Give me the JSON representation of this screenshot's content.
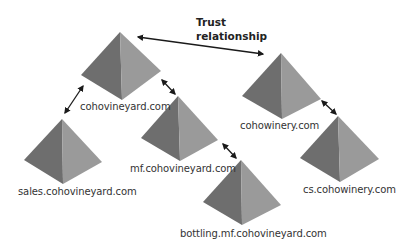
{
  "diagram": {
    "type": "domain trust hierarchy",
    "colors": {
      "face_left": "#6e6e6e",
      "face_right": "#9a9a9a",
      "arrow": "#1a1a1a",
      "background": "#ffffff"
    },
    "trust_label": {
      "line1": "Trust",
      "line2": "relationship"
    },
    "nodes": [
      {
        "id": "cohovineyard",
        "label": "cohovineyard.com"
      },
      {
        "id": "sales",
        "label": "sales.cohovineyard.com"
      },
      {
        "id": "mf",
        "label": "mf.cohovineyard.com"
      },
      {
        "id": "bottling",
        "label": "bottling.mf.cohovineyard.com"
      },
      {
        "id": "cohowinery",
        "label": "cohowinery.com"
      },
      {
        "id": "cs",
        "label": "cs.cohowinery.com"
      }
    ],
    "edges": [
      {
        "from": "cohovineyard",
        "to": "cohowinery",
        "type": "trust",
        "bidirectional": true
      },
      {
        "from": "cohovineyard",
        "to": "sales",
        "bidirectional": true
      },
      {
        "from": "cohovineyard",
        "to": "mf",
        "bidirectional": true
      },
      {
        "from": "mf",
        "to": "bottling",
        "bidirectional": true
      },
      {
        "from": "cohowinery",
        "to": "cs",
        "bidirectional": true
      }
    ]
  }
}
